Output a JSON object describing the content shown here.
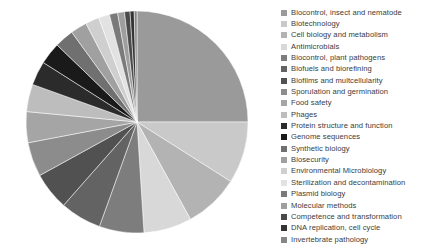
{
  "chart_data": {
    "type": "pie",
    "title": "",
    "legend_position": "right",
    "grid": false,
    "categories": [
      "Biocontrol, insect and nematode",
      "Biotechnology",
      "Cell biology and metabolism",
      "Antimicrobials",
      "Biocontrol, plant pathogens",
      "Biofuels and biorefining",
      "Biofilms and multcellularity",
      "Sporulation and germination",
      "Food safety",
      "Phages",
      "Protein structure and function",
      "Genome sequences",
      "Synthetic biology",
      "Biosecurity",
      "Environmental Microbiology",
      "Sterilization and decontamination",
      "Plasmid biology",
      "Molecular methods",
      "Competence and transformation",
      "DNA replication, cell cycle",
      "Invertebrate pathology"
    ],
    "values": [
      25.0,
      9.0,
      8.0,
      7.0,
      6.5,
      6.0,
      5.5,
      5.0,
      4.5,
      4.0,
      3.5,
      3.2,
      2.8,
      2.4,
      2.0,
      1.6,
      1.2,
      1.0,
      0.8,
      0.6,
      0.4
    ],
    "colors": [
      "#9a9a9a",
      "#c9c9c9",
      "#b3b3b3",
      "#d8d8d8",
      "#7d7d7d",
      "#636363",
      "#515151",
      "#8c8c8c",
      "#a5a5a5",
      "#bdbdbd",
      "#2b2b2b",
      "#1a1a1a",
      "#707070",
      "#a0a0a0",
      "#cfcfcf",
      "#e2e2e2",
      "#7a7a7a",
      "#9e9e9e",
      "#4a4a4a",
      "#343434",
      "#868686"
    ],
    "start_angle_deg": 0,
    "direction": "clockwise"
  },
  "legend": {
    "items": [
      {
        "label": "Biocontrol, insect and nematode",
        "color": "#9a9a9a"
      },
      {
        "label": "Biotechnology",
        "color": "#c9c9c9"
      },
      {
        "label": "Cell biology and metabolism",
        "color": "#b3b3b3"
      },
      {
        "label": "Antimicrobials",
        "color": "#d8d8d8"
      },
      {
        "label": "Biocontrol, plant pathogens",
        "color": "#7d7d7d"
      },
      {
        "label": "Biofuels and biorefining",
        "color": "#636363"
      },
      {
        "label": "Biofilms and multcellularity",
        "color": "#515151"
      },
      {
        "label": "Sporulation and germination",
        "color": "#8c8c8c"
      },
      {
        "label": "Food safety",
        "color": "#a5a5a5"
      },
      {
        "label": "Phages",
        "color": "#bdbdbd"
      },
      {
        "label": "Protein structure and function",
        "color": "#2b2b2b"
      },
      {
        "label": "Genome sequences",
        "color": "#1a1a1a"
      },
      {
        "label": "Synthetic biology",
        "color": "#707070"
      },
      {
        "label": "Biosecurity",
        "color": "#a0a0a0"
      },
      {
        "label": "Environmental Microbiology",
        "color": "#cfcfcf"
      },
      {
        "label": "Sterilization and decontamination",
        "color": "#e2e2e2"
      },
      {
        "label": "Plasmid biology",
        "color": "#7a7a7a"
      },
      {
        "label": "Molecular methods",
        "color": "#9e9e9e"
      },
      {
        "label": "Competence and transformation",
        "color": "#4a4a4a"
      },
      {
        "label": "DNA replication, cell cycle",
        "color": "#343434"
      },
      {
        "label": "Invertebrate pathology",
        "color": "#868686"
      }
    ]
  },
  "geometry": {
    "center_x": 137,
    "center_y": 122,
    "radius": 111
  }
}
